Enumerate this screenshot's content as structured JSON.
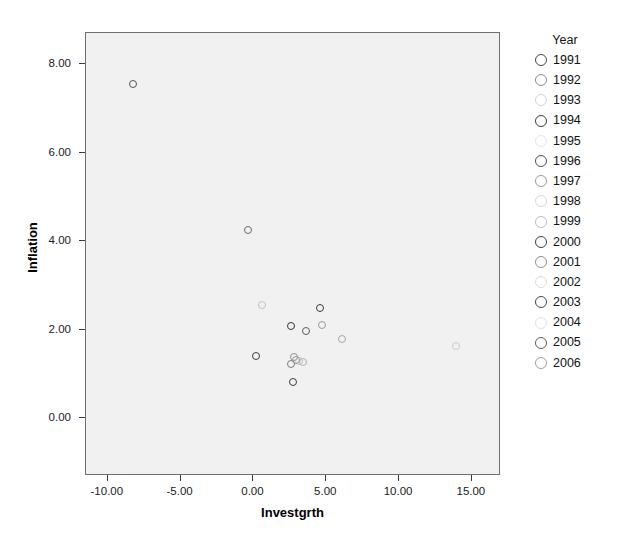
{
  "chart_data": {
    "type": "scatter",
    "title": "",
    "xlabel": "Investgrth",
    "ylabel": "Inflation",
    "xlim": [
      -11.5,
      17.0
    ],
    "ylim": [
      -1.3,
      8.7
    ],
    "grid": false,
    "legend_position": "right",
    "legend_title": "Year",
    "xticks": [
      "-10.00",
      "-5.00",
      "0.00",
      "5.00",
      "10.00",
      "15.00"
    ],
    "xtick_values": [
      -10,
      -5,
      0,
      5,
      10,
      15
    ],
    "yticks": [
      "0.00",
      "2.00",
      "4.00",
      "6.00",
      "8.00"
    ],
    "ytick_values": [
      0,
      2,
      4,
      6,
      8
    ],
    "series": [
      {
        "name": "Year",
        "points": [
          {
            "label": "1991",
            "x": -8.3,
            "y": 7.55,
            "color": "#555555"
          },
          {
            "label": "1992",
            "x": -0.35,
            "y": 4.25,
            "color": "#6b6b6b"
          },
          {
            "label": "1993",
            "x": 0.6,
            "y": 2.55,
            "color": "#c3c3c3"
          },
          {
            "label": "1994",
            "x": 4.6,
            "y": 2.5,
            "color": "#3c3c3c"
          },
          {
            "label": "1995",
            "x": 4.7,
            "y": 2.1,
            "color": "#9a9a9a"
          },
          {
            "label": "1996",
            "x": 2.6,
            "y": 2.08,
            "color": "#3a3a3a"
          },
          {
            "label": "1997",
            "x": 3.6,
            "y": 1.98,
            "color": "#5c5c5c"
          },
          {
            "label": "1998",
            "x": 6.1,
            "y": 1.8,
            "color": "#a7a7a7"
          },
          {
            "label": "1999",
            "x": 13.9,
            "y": 1.63,
            "color": "#c9c9c9"
          },
          {
            "label": "2000",
            "x": 0.15,
            "y": 1.4,
            "color": "#3f3f3f"
          },
          {
            "label": "2001",
            "x": 2.75,
            "y": 1.38,
            "color": "#8f8f8f"
          },
          {
            "label": "2002",
            "x": 3.15,
            "y": 1.3,
            "color": "#c0c0c0"
          },
          {
            "label": "2003",
            "x": 2.55,
            "y": 1.22,
            "color": "#7d7d7d"
          },
          {
            "label": "2004",
            "x": 2.7,
            "y": 0.82,
            "color": "#3d3d3d"
          },
          {
            "label": "2005",
            "x": 3.4,
            "y": 1.28,
            "color": "#b4b4b4"
          },
          {
            "label": "2006",
            "x": 2.95,
            "y": 1.32,
            "color": "#989898"
          }
        ]
      }
    ]
  },
  "axes": {
    "x_title": "Investgrth",
    "y_title": "Inflation"
  },
  "legend": {
    "title": "Year",
    "items": [
      {
        "label": "1991",
        "color": "#4a4a4a"
      },
      {
        "label": "1992",
        "color": "#8c8c8c"
      },
      {
        "label": "1993",
        "color": "#d2d2d2"
      },
      {
        "label": "1994",
        "color": "#3b3b3b"
      },
      {
        "label": "1995",
        "color": "#e4e4e4"
      },
      {
        "label": "1996",
        "color": "#4f4f4f"
      },
      {
        "label": "1997",
        "color": "#9a9a9a"
      },
      {
        "label": "1998",
        "color": "#d8d8d8"
      },
      {
        "label": "1999",
        "color": "#bdbdbd"
      },
      {
        "label": "2000",
        "color": "#3f3f3f"
      },
      {
        "label": "2001",
        "color": "#8f8f8f"
      },
      {
        "label": "2002",
        "color": "#dcdcdc"
      },
      {
        "label": "2003",
        "color": "#454545"
      },
      {
        "label": "2004",
        "color": "#e0e0e0"
      },
      {
        "label": "2005",
        "color": "#5a5a5a"
      },
      {
        "label": "2006",
        "color": "#9e9e9e"
      }
    ]
  },
  "colors": {
    "plot_background": "#f1f1f1",
    "page_background": "#ffffff",
    "frame_border": "#6e6e6e",
    "text": "#111111"
  }
}
